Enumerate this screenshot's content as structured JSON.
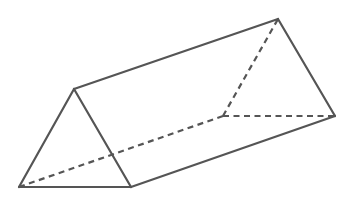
{
  "figure": {
    "type": "triangular-prism",
    "stroke_color": "#555555",
    "background": "#ffffff",
    "vertices": {
      "front_apex": [
        74,
        89
      ],
      "front_left": [
        19,
        187
      ],
      "front_right": [
        131,
        187
      ],
      "back_apex": [
        278,
        19
      ],
      "back_left": [
        223,
        116
      ],
      "back_right": [
        335,
        116
      ]
    },
    "visible_edges": [
      [
        "front_apex",
        "front_left"
      ],
      [
        "front_apex",
        "front_right"
      ],
      [
        "front_left",
        "front_right"
      ],
      [
        "front_apex",
        "back_apex"
      ],
      [
        "front_right",
        "back_right"
      ],
      [
        "back_apex",
        "back_right"
      ]
    ],
    "hidden_edges": [
      [
        "front_left",
        "back_left"
      ],
      [
        "back_left",
        "back_apex"
      ],
      [
        "back_left",
        "back_right"
      ]
    ]
  }
}
